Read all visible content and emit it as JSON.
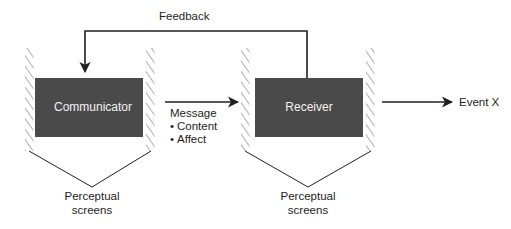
{
  "diagram": {
    "colors": {
      "box_fill": "#4a4a4a",
      "box_label_text": "#f2f2f2",
      "line": "#231f20",
      "hatch": "#8c8c8c",
      "background": "#ffffff"
    },
    "nodes": [
      {
        "id": "communicator",
        "label": "Communicator"
      },
      {
        "id": "receiver",
        "label": "Receiver"
      }
    ],
    "connectors": [
      {
        "id": "feedback",
        "label": "Feedback",
        "from": "receiver",
        "to": "communicator"
      },
      {
        "id": "message",
        "label": "Message",
        "from": "communicator",
        "to": "receiver"
      },
      {
        "id": "event",
        "label": "Event X",
        "from": "receiver",
        "to": "event-x"
      }
    ],
    "message_items": [
      {
        "bullet": "•",
        "label": "Content"
      },
      {
        "bullet": "•",
        "label": "Affect"
      }
    ],
    "screens": [
      {
        "id": "screens-left",
        "line1": "Perceptual",
        "line2": "screens"
      },
      {
        "id": "screens-right",
        "line1": "Perceptual",
        "line2": "screens"
      }
    ]
  }
}
